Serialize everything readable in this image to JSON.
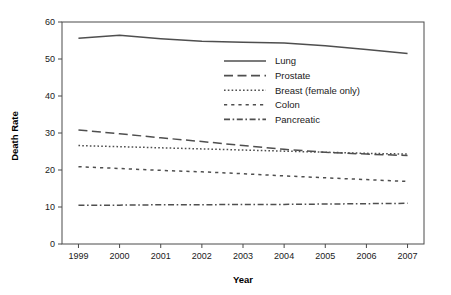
{
  "chart_data": {
    "type": "line",
    "title": "",
    "xlabel": "Year",
    "ylabel": "Death Rate",
    "x": [
      1999,
      2000,
      2001,
      2002,
      2003,
      2004,
      2005,
      2006,
      2007
    ],
    "categories": [
      "1999",
      "2000",
      "2001",
      "2002",
      "2003",
      "2004",
      "2005",
      "2006",
      "2007"
    ],
    "xlim": [
      1998.6,
      2007.4
    ],
    "ylim": [
      0,
      60
    ],
    "yticks": [
      0,
      10,
      20,
      30,
      40,
      50,
      60
    ],
    "ytick_labels": [
      "0",
      "10",
      "20",
      "30",
      "40",
      "50",
      "60"
    ],
    "grid": false,
    "legend_position": "inside-upper-right",
    "series": [
      {
        "name": "Lung",
        "dash": "solid",
        "values": [
          55.6,
          56.4,
          55.5,
          54.8,
          54.5,
          54.3,
          53.6,
          52.6,
          51.5
        ]
      },
      {
        "name": "Prostate",
        "dash": "dashed",
        "values": [
          30.8,
          29.8,
          28.7,
          27.7,
          26.6,
          25.6,
          24.8,
          24.3,
          23.9
        ]
      },
      {
        "name": "Breast (female only)",
        "dash": "dotted",
        "values": [
          26.6,
          26.3,
          26.0,
          25.7,
          25.4,
          25.1,
          24.8,
          24.5,
          24.3
        ]
      },
      {
        "name": "Colon",
        "dash": "dash-short",
        "values": [
          20.9,
          20.4,
          19.9,
          19.5,
          19.0,
          18.4,
          17.9,
          17.4,
          16.9
        ]
      },
      {
        "name": "Pancreatic",
        "dash": "dash-dot",
        "values": [
          10.5,
          10.5,
          10.6,
          10.6,
          10.7,
          10.7,
          10.8,
          10.9,
          11.0
        ]
      }
    ]
  },
  "legend": {
    "items": [
      {
        "label": "Lung"
      },
      {
        "label": "Prostate"
      },
      {
        "label": "Breast (female only)"
      },
      {
        "label": "Colon"
      },
      {
        "label": "Pancreatic"
      }
    ]
  },
  "axes": {
    "y_title": "Death Rate",
    "x_title": "Year"
  }
}
